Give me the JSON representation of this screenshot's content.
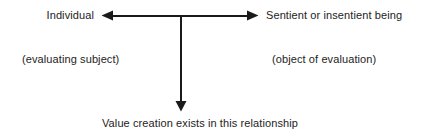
{
  "diagram": {
    "type": "relationship-arrow-diagram",
    "background_color": "#ffffff",
    "stroke_color": "#1a1a1a",
    "text_color": "#232323",
    "labels": {
      "left_node": "Individual",
      "left_node_sub": "(evaluating subject)",
      "right_node": "Sentient or insentient being",
      "right_node_sub": "(object of evaluation)",
      "bottom_caption": "Value creation exists in this relationship"
    },
    "arrows": [
      {
        "name": "left-arrow",
        "direction": "left",
        "from": [
          181,
          15
        ],
        "to": [
          102,
          15
        ],
        "points_at": "Individual"
      },
      {
        "name": "right-arrow",
        "direction": "right",
        "from": [
          181,
          15
        ],
        "to": [
          258,
          15
        ],
        "points_at": "Sentient or insentient being"
      },
      {
        "name": "down-arrow",
        "direction": "down",
        "from": [
          181,
          15
        ],
        "to": [
          181,
          111
        ],
        "points_at": "Value creation exists in this relationship"
      }
    ]
  }
}
